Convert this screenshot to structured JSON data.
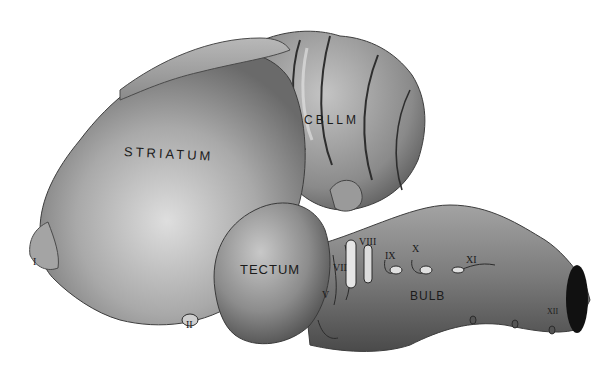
{
  "figure": {
    "regions": {
      "striatum": "STRIATUM",
      "cerebellum": "CBLLM",
      "tectum": "TECTUM",
      "bulb": "BULB"
    },
    "nerves": {
      "n1": "I",
      "n2": "II",
      "n5": "V",
      "n7": "VII",
      "n8": "VIII",
      "n9": "IX",
      "n10": "X",
      "n11": "XI",
      "n12": "XII"
    },
    "colors": {
      "background": "#ffffff",
      "tissue_light": "#c9c9c9",
      "tissue_mid": "#9a9a9a",
      "tissue_dark": "#5a5a5a",
      "cut_surface": "#111111",
      "ink": "#1b1b1b"
    }
  }
}
